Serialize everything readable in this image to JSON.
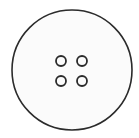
{
  "icon": {
    "name": "button",
    "label": "Sewing button",
    "colors": {
      "background": "#ffffff",
      "fill": "#fbfbfb",
      "stroke": "#2b2b2b"
    },
    "outer_circle": {
      "cx": 72,
      "cy": 70,
      "r": 60,
      "stroke_width": 1.6
    },
    "holes": [
      {
        "cx": 61,
        "cy": 61,
        "r": 5
      },
      {
        "cx": 82,
        "cy": 61,
        "r": 5
      },
      {
        "cx": 61,
        "cy": 81,
        "r": 5
      },
      {
        "cx": 82,
        "cy": 81,
        "r": 5
      }
    ],
    "hole_stroke_width": 1.8
  }
}
